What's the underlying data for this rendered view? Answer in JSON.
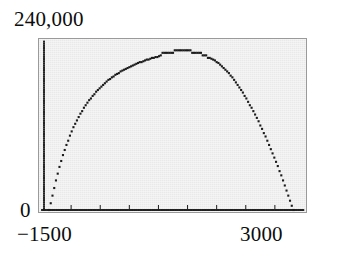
{
  "chart_data": {
    "type": "scatter",
    "title": "",
    "xlabel": "",
    "ylabel": "",
    "xlim": [
      -1500,
      3000
    ],
    "ylim": [
      0,
      240000
    ],
    "grid": false,
    "legend": null,
    "axis_labels": {
      "y_max": "240,000",
      "y_min": "0",
      "x_min": "−1500",
      "x_max": "3000"
    },
    "x_tick_values": [
      -1500,
      3000
    ],
    "y_tick_values": [
      0,
      240000
    ],
    "series": [
      {
        "name": "curve",
        "marker": "dot",
        "color": "#1b1b1b",
        "points": [
          [
            -1380,
            0
          ],
          [
            -1350,
            9600
          ],
          [
            -1320,
            20400
          ],
          [
            -1290,
            31200
          ],
          [
            -1260,
            42000
          ],
          [
            -1230,
            51600
          ],
          [
            -1200,
            61200
          ],
          [
            -1170,
            69600
          ],
          [
            -1140,
            78000
          ],
          [
            -1110,
            85200
          ],
          [
            -1080,
            92400
          ],
          [
            -1050,
            98400
          ],
          [
            -1020,
            105600
          ],
          [
            -990,
            111600
          ],
          [
            -960,
            117600
          ],
          [
            -930,
            122400
          ],
          [
            -900,
            127200
          ],
          [
            -870,
            132000
          ],
          [
            -840,
            136800
          ],
          [
            -810,
            140400
          ],
          [
            -780,
            145200
          ],
          [
            -750,
            148800
          ],
          [
            -720,
            152400
          ],
          [
            -690,
            156000
          ],
          [
            -660,
            158400
          ],
          [
            -630,
            162000
          ],
          [
            -600,
            164400
          ],
          [
            -570,
            168000
          ],
          [
            -540,
            170400
          ],
          [
            -510,
            172800
          ],
          [
            -480,
            175200
          ],
          [
            -450,
            177600
          ],
          [
            -420,
            180000
          ],
          [
            -390,
            182400
          ],
          [
            -360,
            184800
          ],
          [
            -330,
            186000
          ],
          [
            -300,
            188400
          ],
          [
            -270,
            189600
          ],
          [
            -240,
            192000
          ],
          [
            -210,
            193200
          ],
          [
            -180,
            194400
          ],
          [
            -150,
            196800
          ],
          [
            -120,
            198000
          ],
          [
            -90,
            199200
          ],
          [
            -60,
            200400
          ],
          [
            -30,
            201600
          ],
          [
            0,
            202800
          ],
          [
            30,
            204000
          ],
          [
            60,
            205200
          ],
          [
            90,
            206400
          ],
          [
            120,
            207600
          ],
          [
            150,
            208800
          ],
          [
            180,
            210000
          ],
          [
            210,
            210000
          ],
          [
            240,
            211200
          ],
          [
            270,
            212400
          ],
          [
            300,
            213600
          ],
          [
            330,
            213600
          ],
          [
            360,
            214800
          ],
          [
            390,
            216000
          ],
          [
            420,
            216000
          ],
          [
            450,
            217200
          ],
          [
            480,
            217200
          ],
          [
            510,
            218400
          ],
          [
            540,
            219600
          ],
          [
            570,
            223200
          ],
          [
            600,
            223200
          ],
          [
            630,
            223200
          ],
          [
            660,
            223200
          ],
          [
            690,
            223200
          ],
          [
            720,
            223200
          ],
          [
            750,
            223200
          ],
          [
            780,
            226800
          ],
          [
            810,
            226800
          ],
          [
            840,
            226800
          ],
          [
            870,
            226800
          ],
          [
            900,
            226800
          ],
          [
            930,
            226800
          ],
          [
            960,
            226800
          ],
          [
            990,
            226800
          ],
          [
            1020,
            226800
          ],
          [
            1050,
            226800
          ],
          [
            1080,
            223200
          ],
          [
            1110,
            223200
          ],
          [
            1140,
            223200
          ],
          [
            1170,
            223200
          ],
          [
            1200,
            223200
          ],
          [
            1230,
            223200
          ],
          [
            1260,
            219600
          ],
          [
            1290,
            219600
          ],
          [
            1320,
            219600
          ],
          [
            1350,
            216000
          ],
          [
            1380,
            216000
          ],
          [
            1410,
            214800
          ],
          [
            1440,
            213600
          ],
          [
            1470,
            212400
          ],
          [
            1500,
            210000
          ],
          [
            1530,
            208800
          ],
          [
            1560,
            206400
          ],
          [
            1590,
            204000
          ],
          [
            1620,
            201600
          ],
          [
            1650,
            199200
          ],
          [
            1680,
            196800
          ],
          [
            1710,
            194400
          ],
          [
            1740,
            190800
          ],
          [
            1770,
            188400
          ],
          [
            1800,
            184800
          ],
          [
            1830,
            181200
          ],
          [
            1860,
            177600
          ],
          [
            1890,
            174000
          ],
          [
            1920,
            170400
          ],
          [
            1950,
            166800
          ],
          [
            1980,
            162000
          ],
          [
            2010,
            158400
          ],
          [
            2040,
            153600
          ],
          [
            2070,
            148800
          ],
          [
            2100,
            145200
          ],
          [
            2130,
            140400
          ],
          [
            2160,
            135600
          ],
          [
            2190,
            130800
          ],
          [
            2220,
            126000
          ],
          [
            2250,
            120000
          ],
          [
            2280,
            115200
          ],
          [
            2310,
            109200
          ],
          [
            2340,
            104400
          ],
          [
            2370,
            98400
          ],
          [
            2400,
            92400
          ],
          [
            2430,
            86400
          ],
          [
            2460,
            80400
          ],
          [
            2490,
            74400
          ],
          [
            2520,
            68400
          ],
          [
            2550,
            62400
          ],
          [
            2580,
            55200
          ],
          [
            2610,
            49200
          ],
          [
            2640,
            42000
          ],
          [
            2670,
            34800
          ],
          [
            2700,
            27600
          ],
          [
            2730,
            20400
          ],
          [
            2760,
            13200
          ],
          [
            2790,
            6000
          ],
          [
            2820,
            0
          ]
        ]
      },
      {
        "name": "left-edge-column",
        "marker": "dot",
        "color": "#1b1b1b",
        "description": "vertical dotted line of points at x = -1500 spanning y = 0 to 240,000",
        "x": -1500,
        "y_from": 0,
        "y_to": 240000
      },
      {
        "name": "baseline",
        "marker": "dot",
        "color": "#1b1b1b",
        "description": "horizontal dotted line of points at y = 0 spanning x = -1500 to 3000",
        "y": 0,
        "x_from": -1500,
        "x_to": 3000
      }
    ],
    "baseline_ticks": [
      -1000,
      -500,
      0,
      500,
      1000,
      1500,
      2000,
      2500
    ],
    "panel_background": "#e9e9e9",
    "panel_border": "#9a9a9a",
    "marker_color": "#1b1b1b"
  }
}
